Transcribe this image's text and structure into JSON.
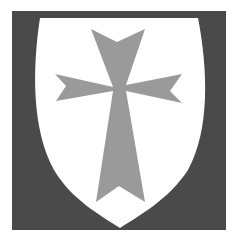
{
  "image": {
    "description": "Heraldic shield: white shield bearing a grey cross moline/patée on a dark grey square field",
    "colors": {
      "background": "#ffffff",
      "field": "#4a4a4a",
      "shield": "#ffffff",
      "cross": "#9a9a9a"
    }
  }
}
